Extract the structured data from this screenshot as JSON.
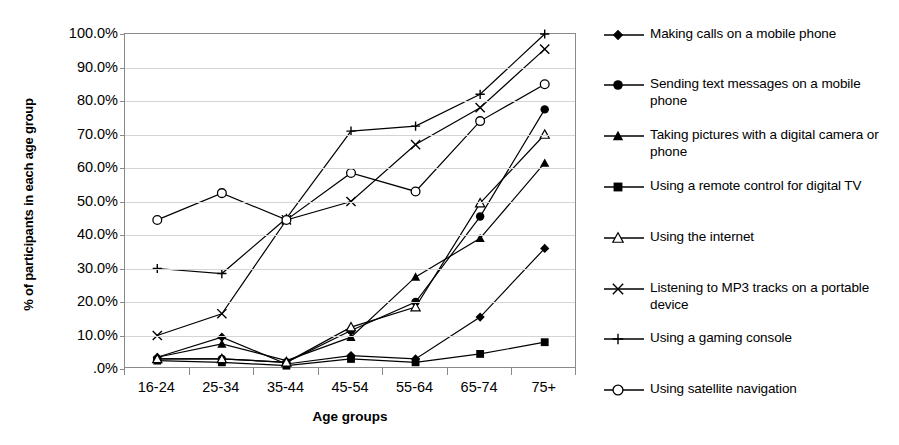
{
  "chart_data": {
    "type": "line",
    "title": "",
    "xlabel": "Age groups",
    "ylabel": "% of participants in each age group",
    "categories": [
      "16-24",
      "25-34",
      "35-44",
      "45-54",
      "55-64",
      "65-74",
      "75+"
    ],
    "ylim": [
      0,
      100
    ],
    "ytick_labels": [
      "100.0%",
      "90.0%",
      "80.0%",
      "70.0%",
      "60.0%",
      "50.0%",
      "40.0%",
      "30.0%",
      "20.0%",
      "10.0%",
      ".0%"
    ],
    "ytick_values": [
      100,
      90,
      80,
      70,
      60,
      50,
      40,
      30,
      20,
      10,
      0
    ],
    "grid": true,
    "legend_position": "right",
    "series": [
      {
        "name": "Making calls on a mobile phone",
        "marker": "filled-diamond",
        "values": [
          3.5,
          9.5,
          1.5,
          4.0,
          3.0,
          15.5,
          36.0
        ]
      },
      {
        "name": "Sending text messages on a mobile phone",
        "marker": "filled-circle",
        "values": [
          3.0,
          3.0,
          2.0,
          11.5,
          20.0,
          45.5,
          77.5
        ]
      },
      {
        "name": "Taking pictures with a digital camera or phone",
        "marker": "filled-triangle",
        "values": [
          3.5,
          7.5,
          2.5,
          9.5,
          27.5,
          39.0,
          61.5
        ]
      },
      {
        "name": "Using a remote control for digital TV",
        "marker": "filled-square",
        "values": [
          2.5,
          2.0,
          1.0,
          3.0,
          2.0,
          4.5,
          8.0
        ]
      },
      {
        "name": "Using the internet",
        "marker": "open-triangle",
        "values": [
          3.0,
          3.0,
          2.0,
          12.5,
          18.5,
          49.5,
          70.0
        ]
      },
      {
        "name": "Listening to MP3 tracks on a portable device",
        "marker": "cross-x",
        "values": [
          10.0,
          16.5,
          44.5,
          50.0,
          67.0,
          78.0,
          95.5
        ]
      },
      {
        "name": "Using a gaming console",
        "marker": "plus",
        "values": [
          30.0,
          28.5,
          45.0,
          71.0,
          72.5,
          82.0,
          100.0
        ]
      },
      {
        "name": "Using satellite navigation",
        "marker": "open-circle",
        "values": [
          44.5,
          52.5,
          44.5,
          58.5,
          53.0,
          74.0,
          85.0
        ]
      }
    ]
  },
  "legend": {
    "items": [
      {
        "label": "Making calls on a mobile phone",
        "marker": "filled-diamond",
        "top": 26
      },
      {
        "label": "Sending text messages on a mobile phone",
        "marker": "filled-circle",
        "top": 76
      },
      {
        "label": "Taking pictures with a digital camera or phone",
        "marker": "filled-triangle",
        "top": 127
      },
      {
        "label": "Using a remote control for digital TV",
        "marker": "filled-square",
        "top": 178
      },
      {
        "label": "Using the internet",
        "marker": "open-triangle",
        "top": 229
      },
      {
        "label": "Listening to MP3 tracks on a portable device",
        "marker": "cross-x",
        "top": 280
      },
      {
        "label": "Using a gaming console",
        "marker": "plus",
        "top": 330
      },
      {
        "label": "Using satellite navigation",
        "marker": "open-circle",
        "top": 381
      }
    ]
  }
}
